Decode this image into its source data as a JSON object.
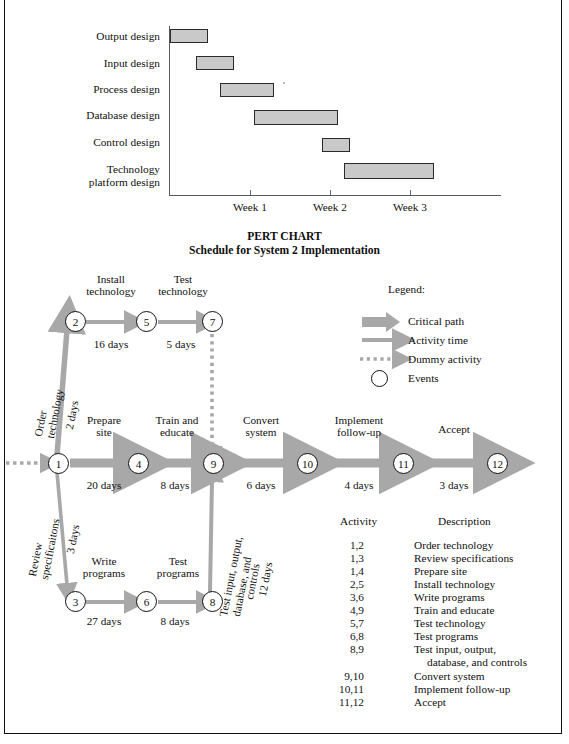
{
  "page": {
    "gantt_title": "Schedule for System 2 Implementation",
    "pert_title_line1": "PERT CHART",
    "pert_title_line2": "Schedule for System 2 Implementation"
  },
  "colors": {
    "bar_fill": "#c9c9c9",
    "bar_stroke": "#2b2b2b",
    "arrow_gray": "#a8a8a8",
    "axis_gray": "#5a5a5a",
    "text": "#101010"
  },
  "chart_data": {
    "type": "bar",
    "subtype": "gantt",
    "title": "Schedule for System 2 Implementation",
    "xlabel": "",
    "ylabel": "",
    "grid": false,
    "legend": "none",
    "xticklabels": [
      "Week 1",
      "Week 2",
      "Week 3"
    ],
    "xtick_weeks": [
      1,
      2,
      3
    ],
    "xlim": [
      0,
      3.6
    ],
    "categories": [
      "Output design",
      "Input design",
      "Process design",
      "Database design",
      "Control design",
      "Technology platform design"
    ],
    "tasks": [
      {
        "name": "Output design",
        "start_week": 0.0,
        "end_week": 0.48
      },
      {
        "name": "Input design",
        "start_week": 0.32,
        "end_week": 0.8
      },
      {
        "name": "Process design",
        "start_week": 0.62,
        "end_week": 1.3
      },
      {
        "name": "Database design",
        "start_week": 1.05,
        "end_week": 2.1
      },
      {
        "name": "Control design",
        "start_week": 1.9,
        "end_week": 2.25
      },
      {
        "name": "Technology platform design",
        "start_week": 2.18,
        "end_week": 3.3
      }
    ]
  },
  "gantt": {
    "labels": [
      {
        "text": "Output design",
        "two_line": false
      },
      {
        "text": "Input design",
        "two_line": false
      },
      {
        "text": "Process design",
        "two_line": false
      },
      {
        "text": "Database design",
        "two_line": false
      },
      {
        "text": "Control design",
        "two_line": false
      },
      {
        "text": "Technology",
        "text2": "platform design",
        "two_line": true
      }
    ],
    "weeks": [
      "Week 1",
      "Week 2",
      "Week 3"
    ]
  },
  "pert": {
    "nodes": [
      "1",
      "2",
      "3",
      "4",
      "5",
      "6",
      "7",
      "8",
      "9",
      "10",
      "11",
      "12"
    ],
    "edge_labels": {
      "n2_n5_name": "Install technology",
      "n2_n5_name_l1": "Install",
      "n2_n5_name_l2": "technology",
      "n2_n5_days": "16 days",
      "n5_n7_name_l1": "Test",
      "n5_n7_name_l2": "technology",
      "n5_n7_days": "5 days",
      "n1_n2_name_l1": "Order",
      "n1_n2_name_l2": "technology",
      "n1_n2_days": "2 days",
      "n1_n3_name_l1": "Review",
      "n1_n3_name_l2": "specificaitons",
      "n1_n3_days": "3 days",
      "n1_n4_name_l1": "Prepare",
      "n1_n4_name_l2": "site",
      "n1_n4_days": "20 days",
      "n4_n9_name_l1": "Train and",
      "n4_n9_name_l2": "educate",
      "n4_n9_days": "8 days",
      "n9_n10_name_l1": "Convert",
      "n9_n10_name_l2": "system",
      "n9_n10_days": "6 days",
      "n10_n11_name_l1": "Implement",
      "n10_n11_name_l2": "follow-up",
      "n10_n11_days": "4 days",
      "n11_n12_name": "Accept",
      "n11_n12_days": "3 days",
      "n3_n6_name_l1": "Write",
      "n3_n6_name_l2": "programs",
      "n3_n6_days": "27 days",
      "n6_n8_name_l1": "Test",
      "n6_n8_name_l2": "programs",
      "n6_n8_days": "8 days",
      "n8_n9_name_l1": "Test input, output,",
      "n8_n9_name_l2": "database, and",
      "n8_n9_name_l3": "controls",
      "n8_n9_days": "12 days"
    },
    "legend": {
      "title": "Legend:",
      "items": [
        {
          "label": "Critical path",
          "icon": "thick-arrow-icon"
        },
        {
          "label": "Activity time",
          "icon": "thin-arrow-icon"
        },
        {
          "label": "Dummy activity",
          "icon": "dotted-arrow-icon"
        },
        {
          "label": "Events",
          "icon": "circle-icon"
        }
      ]
    }
  },
  "activity_table": {
    "headers": {
      "activity": "Activity",
      "description": "Description"
    },
    "rows": [
      {
        "activity": "1,2",
        "description": "Order technology"
      },
      {
        "activity": "1,3",
        "description": "Review specifications"
      },
      {
        "activity": "1,4",
        "description": "Prepare site"
      },
      {
        "activity": "2,5",
        "description": "Install technology"
      },
      {
        "activity": "3,6",
        "description": "Write programs"
      },
      {
        "activity": "4,9",
        "description": "Train and educate"
      },
      {
        "activity": "5,7",
        "description": "Test technology"
      },
      {
        "activity": "6,8",
        "description": "Test programs"
      },
      {
        "activity": "8,9",
        "description": "Test input, output,",
        "description2": "database, and controls"
      },
      {
        "activity": "9,10",
        "description": "Convert system"
      },
      {
        "activity": "10,11",
        "description": "Implement follow-up"
      },
      {
        "activity": "11,12",
        "description": "Accept"
      }
    ]
  }
}
